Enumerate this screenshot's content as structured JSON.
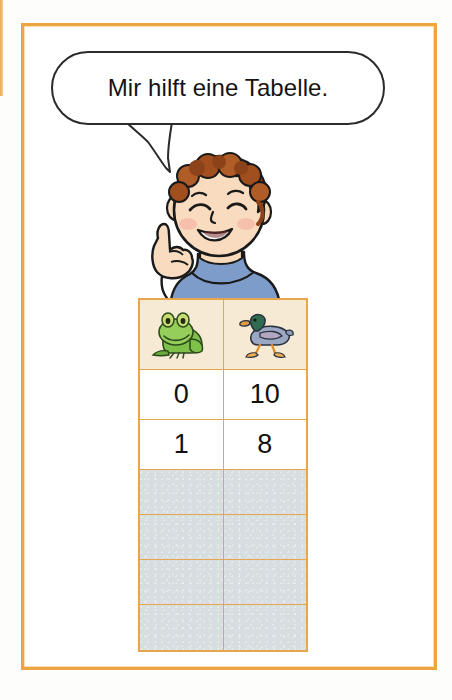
{
  "page": {
    "background_color": "#fdfdfb",
    "frame_color": "#eda544"
  },
  "speech_bubble": {
    "text": "Mir hilft eine Tabelle.",
    "outline_color": "#2b2b2b",
    "fill_color": "#ffffff"
  },
  "character": {
    "name": "boy-pointing-up",
    "hair_color": "#9c4a1e",
    "skin_color": "#f6d5b6",
    "shirt_color": "#6f8fc0"
  },
  "table": {
    "border_color": "#e8a64c",
    "header_background": "#f6ead5",
    "empty_row_background": "#d7dee1",
    "columns": [
      {
        "icon": "frog-icon",
        "label": "Frosch"
      },
      {
        "icon": "duck-icon",
        "label": "Ente"
      }
    ],
    "rows": [
      {
        "frog": "0",
        "duck": "10",
        "filled": true
      },
      {
        "frog": "1",
        "duck": "8",
        "filled": true
      },
      {
        "frog": "",
        "duck": "",
        "filled": false
      },
      {
        "frog": "",
        "duck": "",
        "filled": false
      },
      {
        "frog": "",
        "duck": "",
        "filled": false
      },
      {
        "frog": "",
        "duck": "",
        "filled": false
      }
    ]
  }
}
